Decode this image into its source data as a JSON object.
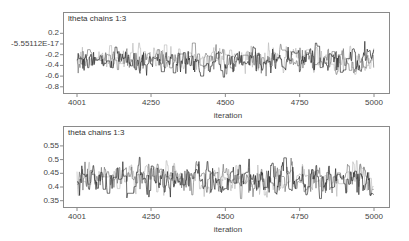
{
  "chart_data": [
    {
      "type": "line",
      "title": "ltheta chains 1:3",
      "xlabel": "iteration",
      "ylabel": "",
      "x_range": [
        4001,
        5000
      ],
      "x_ticks": [
        4001,
        4250,
        4500,
        4750,
        5000
      ],
      "x_tick_labels": [
        "4001",
        "4250",
        "4500",
        "4750",
        "5000"
      ],
      "y_ticks": [
        0.2,
        0.0,
        -0.2,
        -0.4,
        -0.6,
        -0.8
      ],
      "y_tick_labels": [
        "0.2",
        "-5.55112E-17",
        "-0.2",
        "-0.4",
        "-0.6",
        "-0.8"
      ],
      "ylim": [
        -0.88,
        0.38
      ],
      "grid": false,
      "legend": "none",
      "series": [
        {
          "name": "chain 1",
          "color": "#2b2b2b",
          "mean": -0.3,
          "sd": 0.12,
          "min": -0.65,
          "max": 0.05
        },
        {
          "name": "chain 2",
          "color": "#7a7a7a",
          "mean": -0.3,
          "sd": 0.11,
          "min": -0.62,
          "max": 0.02
        },
        {
          "name": "chain 3",
          "color": "#bdbdbd",
          "mean": -0.28,
          "sd": 0.11,
          "min": -0.6,
          "max": 0.05
        }
      ]
    },
    {
      "type": "line",
      "title": "theta chains 1:3",
      "xlabel": "iteration",
      "ylabel": "",
      "x_range": [
        4001,
        5000
      ],
      "x_ticks": [
        4001,
        4250,
        4500,
        4750,
        5000
      ],
      "x_tick_labels": [
        "4001",
        "4250",
        "4500",
        "4750",
        "5000"
      ],
      "y_ticks": [
        0.55,
        0.5,
        0.45,
        0.4,
        0.35
      ],
      "y_tick_labels": [
        "0.55",
        "0.5",
        "0.45",
        "0.4",
        "0.35"
      ],
      "ylim": [
        0.33,
        0.625
      ],
      "grid": false,
      "legend": "none",
      "series": [
        {
          "name": "chain 1",
          "color": "#2b2b2b",
          "mean": 0.43,
          "sd": 0.028,
          "min": 0.345,
          "max": 0.525
        },
        {
          "name": "chain 2",
          "color": "#7a7a7a",
          "mean": 0.43,
          "sd": 0.026,
          "min": 0.35,
          "max": 0.51
        },
        {
          "name": "chain 3",
          "color": "#bdbdbd",
          "mean": 0.435,
          "sd": 0.025,
          "min": 0.36,
          "max": 0.51
        }
      ]
    }
  ]
}
